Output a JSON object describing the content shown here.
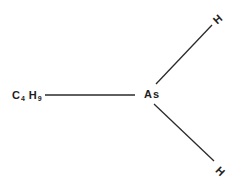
{
  "diagram": {
    "type": "chemical-structure",
    "molecule": "butylarsine",
    "central_atom": {
      "symbol": "As"
    },
    "substituents": [
      {
        "id": "butyl",
        "element": "C",
        "count": "4",
        "element2": "H",
        "count2": "9",
        "position": "left"
      },
      {
        "id": "h-top",
        "symbol": "H",
        "position": "upper-right"
      },
      {
        "id": "h-bottom",
        "symbol": "H",
        "position": "lower-right"
      }
    ],
    "bonds": [
      {
        "from": "butyl",
        "to": "As",
        "x1": 45,
        "y1": 95,
        "x2": 135,
        "y2": 95
      },
      {
        "from": "As",
        "to": "h-top",
        "x1": 156,
        "y1": 84,
        "x2": 212,
        "y2": 25
      },
      {
        "from": "As",
        "to": "h-bottom",
        "x1": 154,
        "y1": 104,
        "x2": 214,
        "y2": 161
      }
    ],
    "colors": {
      "ink": "#1e1e1e",
      "background": "#ffffff"
    }
  }
}
